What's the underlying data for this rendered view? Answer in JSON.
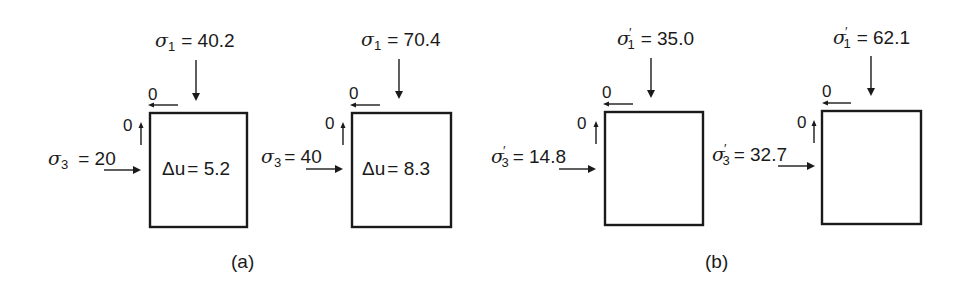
{
  "figure": {
    "panels": [
      {
        "label": "(a)",
        "stress_type": "total",
        "elements": [
          {
            "sigma1_symbol": "σ",
            "sigma1_sub": "1",
            "sigma1_prime": "",
            "sigma1_value": "= 40.2",
            "sigma3_symbol": "σ",
            "sigma3_sub": "3",
            "sigma3_prime": "",
            "sigma3_value": "= 20",
            "shear_top": "0",
            "shear_left": "0",
            "pore_pressure_symbol": "Δu",
            "pore_pressure_value": "= 5.2"
          },
          {
            "sigma1_symbol": "σ",
            "sigma1_sub": "1",
            "sigma1_prime": "",
            "sigma1_value": "= 70.4",
            "sigma3_symbol": "σ",
            "sigma3_sub": "3",
            "sigma3_prime": "",
            "sigma3_value": "= 40",
            "shear_top": "0",
            "shear_left": "0",
            "pore_pressure_symbol": "Δu",
            "pore_pressure_value": "= 8.3"
          }
        ]
      },
      {
        "label": "(b)",
        "stress_type": "effective",
        "elements": [
          {
            "sigma1_symbol": "σ",
            "sigma1_sub": "1",
            "sigma1_prime": "′",
            "sigma1_value": "= 35.0",
            "sigma3_symbol": "σ",
            "sigma3_sub": "3",
            "sigma3_prime": "′",
            "sigma3_value": "= 14.8",
            "shear_top": "0",
            "shear_left": "0",
            "pore_pressure_symbol": "",
            "pore_pressure_value": ""
          },
          {
            "sigma1_symbol": "σ",
            "sigma1_sub": "1",
            "sigma1_prime": "′",
            "sigma1_value": "= 62.1",
            "sigma3_symbol": "σ",
            "sigma3_sub": "3",
            "sigma3_prime": "′",
            "sigma3_value": "= 32.7",
            "shear_top": "0",
            "shear_left": "0",
            "pore_pressure_symbol": "",
            "pore_pressure_value": ""
          }
        ]
      }
    ]
  },
  "colors": {
    "ink": "#1a1a1a",
    "background": "#ffffff"
  }
}
